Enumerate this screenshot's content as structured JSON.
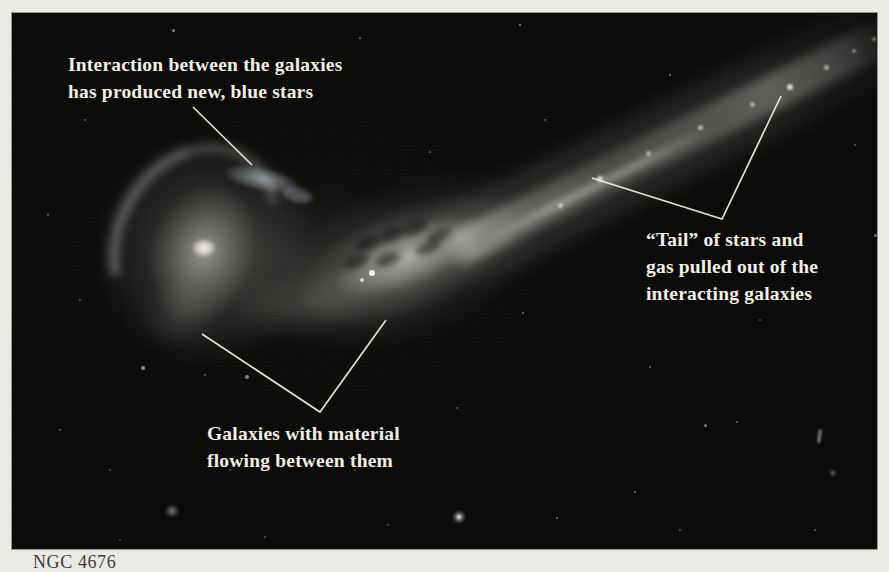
{
  "figure": {
    "caption": "NGC 4676",
    "annotations": [
      {
        "id": "blue-stars",
        "lines": [
          "Interaction between the galaxies",
          "has produced new, blue stars"
        ]
      },
      {
        "id": "tail",
        "lines": [
          "“Tail” of stars and",
          "gas pulled out of the",
          "interacting galaxies"
        ]
      },
      {
        "id": "bridge",
        "lines": [
          "Galaxies with material",
          "flowing between them"
        ]
      }
    ],
    "leader_lines": [
      {
        "for": "blue-stars",
        "points": "193,107 252,165"
      },
      {
        "for": "tail",
        "points": "592,178 722,219 781,96"
      },
      {
        "for": "bridge",
        "points": "202,334 320,412 386,320"
      }
    ],
    "colors": {
      "page_bg": "#ebeae6",
      "photo_bg": "#0a0a09",
      "annotation_text": "#f2efe6",
      "leader_line": "#eeebe1",
      "caption_text": "#3d3b37"
    }
  },
  "sky": {
    "stars": [
      [
        161,
        17,
        1.5,
        0.5
      ],
      [
        348,
        25,
        1.2,
        0.4
      ],
      [
        508,
        12,
        1.3,
        0.5
      ],
      [
        658,
        62,
        1.2,
        0.45
      ],
      [
        73,
        107,
        1.2,
        0.35
      ],
      [
        36,
        202,
        1.2,
        0.35
      ],
      [
        418,
        139,
        1.2,
        0.35
      ],
      [
        533,
        107,
        1.1,
        0.3
      ],
      [
        863,
        222,
        1.5,
        0.4
      ],
      [
        843,
        132,
        1.2,
        0.3
      ],
      [
        131,
        355,
        1.8,
        0.5
      ],
      [
        235,
        364,
        1.8,
        0.45
      ],
      [
        68,
        287,
        1.2,
        0.3
      ],
      [
        48,
        417,
        1.3,
        0.35
      ],
      [
        98,
        457,
        1.2,
        0.3
      ],
      [
        511,
        300,
        1.4,
        0.4
      ],
      [
        638,
        354,
        1.3,
        0.4
      ],
      [
        693,
        412,
        1.5,
        0.45
      ],
      [
        725,
        409,
        1.3,
        0.35
      ],
      [
        545,
        505,
        1.3,
        0.4
      ],
      [
        623,
        479,
        1.4,
        0.4
      ],
      [
        445,
        395,
        1.2,
        0.3
      ],
      [
        288,
        417,
        1.2,
        0.3
      ],
      [
        343,
        457,
        1.1,
        0.3
      ],
      [
        218,
        457,
        1.2,
        0.3
      ],
      [
        668,
        517,
        1.1,
        0.3
      ],
      [
        748,
        307,
        1.2,
        0.3
      ],
      [
        803,
        517,
        1.1,
        0.3
      ],
      [
        253,
        524,
        1.2,
        0.3
      ],
      [
        376,
        512,
        1.1,
        0.3
      ],
      [
        108,
        527,
        1.0,
        0.25
      ],
      [
        193,
        362,
        1.3,
        0.35
      ]
    ],
    "objects": [
      {
        "type": "bright-star",
        "x": 447,
        "y": 504,
        "r": 9
      },
      {
        "type": "fuzzy-galaxy",
        "x": 160,
        "y": 498,
        "r": 8
      },
      {
        "type": "streak",
        "x": 807,
        "y": 423,
        "w": 3,
        "h": 14
      },
      {
        "type": "blob",
        "x": 821,
        "y": 460,
        "r": 4
      }
    ],
    "tail_knots": [
      [
        548,
        192,
        2.5,
        0.6
      ],
      [
        588,
        166,
        3,
        0.75
      ],
      [
        636,
        140,
        2.5,
        0.55
      ],
      [
        688,
        114,
        2.5,
        0.6
      ],
      [
        740,
        91,
        2.5,
        0.55
      ],
      [
        778,
        74,
        3,
        0.8
      ],
      [
        814,
        54,
        2.5,
        0.6
      ],
      [
        842,
        38,
        2,
        0.5
      ],
      [
        862,
        26,
        2,
        0.45
      ]
    ]
  }
}
